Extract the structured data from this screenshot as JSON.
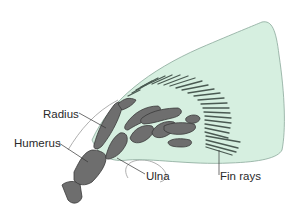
{
  "diagram": {
    "colors": {
      "fin_fill": "#d6efe0",
      "fin_outline": "#8aa89a",
      "bone_fill": "#6e6e6e",
      "bone_outline": "#3a3a3a",
      "ray_color": "#4a5a52",
      "leader_line": "#333333",
      "body_outline": "#9a9a9a"
    },
    "labels": [
      {
        "id": "radius",
        "text": "Radius",
        "x": 43,
        "y": 109
      },
      {
        "id": "humerus",
        "text": "Humerus",
        "x": 14,
        "y": 138
      },
      {
        "id": "ulna",
        "text": "Ulna",
        "x": 146,
        "y": 171
      },
      {
        "id": "fin_rays",
        "text": "Fin rays",
        "x": 219,
        "y": 171
      }
    ]
  }
}
